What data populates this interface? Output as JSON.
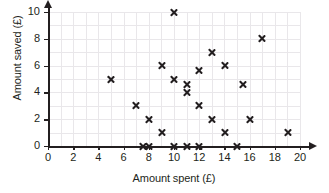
{
  "chart_data": {
    "type": "scatter",
    "title": "",
    "xlabel": "Amount spent (£)",
    "ylabel": "Amount saved (£)",
    "xlim": [
      0,
      20
    ],
    "ylim": [
      0,
      10
    ],
    "x_ticks": [
      0,
      2,
      4,
      6,
      8,
      10,
      12,
      14,
      16,
      18,
      20
    ],
    "y_ticks": [
      0,
      2,
      4,
      6,
      8,
      10
    ],
    "x_tick_labels": [
      "0",
      "2",
      "4",
      "6",
      "8",
      "10",
      "12",
      "14",
      "16",
      "18",
      "20"
    ],
    "y_tick_labels": [
      "0",
      "2",
      "4",
      "6",
      "8",
      "10"
    ],
    "grid": true,
    "grid_step_x": 1,
    "grid_step_y": 1,
    "legend": null,
    "marker": "x",
    "marker_color": "#231f20",
    "grid_color": "#e9e7ea",
    "axis_color": "#231f20",
    "points": [
      {
        "x": 5,
        "y": 5
      },
      {
        "x": 7,
        "y": 3
      },
      {
        "x": 7.5,
        "y": 0
      },
      {
        "x": 8,
        "y": 2
      },
      {
        "x": 8,
        "y": 0
      },
      {
        "x": 9,
        "y": 6
      },
      {
        "x": 9,
        "y": 1
      },
      {
        "x": 10,
        "y": 10
      },
      {
        "x": 10,
        "y": 5
      },
      {
        "x": 10,
        "y": 0
      },
      {
        "x": 11,
        "y": 4.6
      },
      {
        "x": 11,
        "y": 4
      },
      {
        "x": 11,
        "y": 0
      },
      {
        "x": 12,
        "y": 5.6
      },
      {
        "x": 12,
        "y": 3
      },
      {
        "x": 12,
        "y": 0
      },
      {
        "x": 13,
        "y": 7
      },
      {
        "x": 13,
        "y": 2
      },
      {
        "x": 14,
        "y": 6
      },
      {
        "x": 14,
        "y": 1
      },
      {
        "x": 15,
        "y": 0
      },
      {
        "x": 15.5,
        "y": 4.6
      },
      {
        "x": 16,
        "y": 2
      },
      {
        "x": 17,
        "y": 8
      },
      {
        "x": 19,
        "y": 1
      }
    ]
  }
}
